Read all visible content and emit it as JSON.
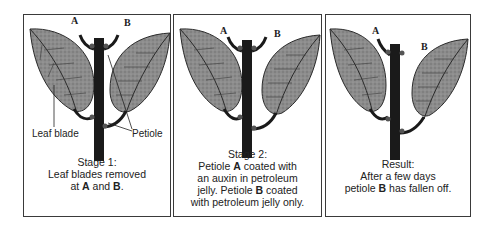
{
  "figure": {
    "panels": [
      {
        "id": "stage1",
        "label_a": "A",
        "label_b": "B",
        "part_labels": {
          "leaf_blade": "Leaf blade",
          "petiole": "Petiole"
        },
        "caption": {
          "line1": "Stage 1:",
          "line2": "Leaf blades removed",
          "line3_pre": "at ",
          "line3_a": "A",
          "line3_mid": " and ",
          "line3_b": "B",
          "line3_post": "."
        }
      },
      {
        "id": "stage2",
        "label_a": "A",
        "label_b": "B",
        "caption": {
          "line1": "Stage 2:",
          "line2_pre": "Petiole ",
          "line2_a": "A",
          "line2_post": " coated with",
          "line3": "an auxin in petroleum",
          "line4_pre": "jelly. Petiole ",
          "line4_b": "B",
          "line4_post": " coated",
          "line5": "with petroleum jelly only."
        }
      },
      {
        "id": "result",
        "label_a": "A",
        "label_b": "B",
        "caption": {
          "line1": "Result:",
          "line2": "After a few days",
          "line3_pre": "petiole ",
          "line3_b": "B",
          "line3_post": " has fallen off."
        }
      }
    ],
    "colors": {
      "stem": "#1a1a1a",
      "leaf_fill": "#8a8a8a",
      "leaf_edge": "#2a2a2a",
      "border": "#3a3a3a"
    }
  }
}
